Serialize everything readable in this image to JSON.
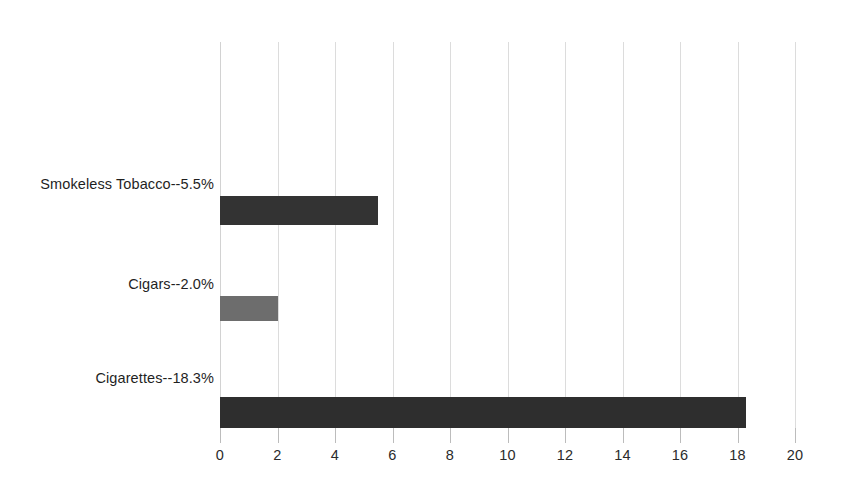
{
  "chart_data": {
    "type": "bar",
    "orientation": "horizontal",
    "title": "",
    "subtitle": "",
    "xlabel": "",
    "ylabel": "",
    "categories": [
      "Cigarettes--18.3%",
      "Cigars--2.0%",
      "Smokeless Tobacco--5.5%"
    ],
    "values": [
      18.3,
      2.0,
      5.5
    ],
    "series": [
      {
        "name": "Percent of users",
        "values": [
          18.3,
          2.0,
          5.5
        ]
      }
    ],
    "bar_colors": [
      "#2e2e2e",
      "#6d6d6d",
      "#333333"
    ],
    "xlim": [
      0,
      20
    ],
    "xticks": [
      0,
      2,
      4,
      6,
      8,
      10,
      12,
      14,
      16,
      18,
      20
    ],
    "xtick_labels": [
      "0",
      "2",
      "4",
      "6",
      "8",
      "10",
      "12",
      "14",
      "16",
      "18",
      "20"
    ],
    "grid": "vertical",
    "gridline_color": "#dcdcdc",
    "legend": "none",
    "legend_position": "none",
    "background_color": "#ffffff",
    "annotations": []
  },
  "bars": [
    {
      "label": "Smokeless Tobacco--5.5%",
      "short_name": "smokeless-tobacco",
      "value": 5.5,
      "value_text": "5.5%",
      "color": "#333333",
      "top_px": 196,
      "height_px": 29,
      "label_top_px": 176
    },
    {
      "label": "Cigars--2.0%",
      "short_name": "cigars",
      "value": 2.0,
      "value_text": "2.0%",
      "color": "#6d6d6d",
      "top_px": 296,
      "height_px": 25,
      "label_top_px": 276
    },
    {
      "label": "Cigarettes--18.3%",
      "short_name": "cigarettes",
      "value": 18.3,
      "value_text": "18.3%",
      "color": "#2e2e2e",
      "top_px": 397,
      "height_px": 31,
      "label_top_px": 370
    }
  ],
  "axis": {
    "x_min": 0,
    "x_max": 20,
    "ticks": [
      "0",
      "2",
      "4",
      "6",
      "8",
      "10",
      "12",
      "14",
      "16",
      "18",
      "20"
    ]
  }
}
